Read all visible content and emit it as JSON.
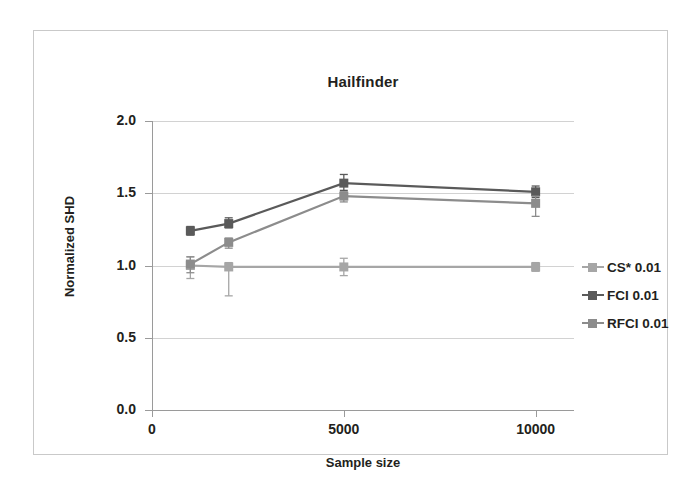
{
  "chart_data": {
    "type": "line",
    "title": "Hailfinder",
    "xlabel": "Sample size",
    "ylabel": "Normalized SHD",
    "x": [
      1000,
      2000,
      5000,
      10000
    ],
    "xlim": [
      0,
      11000
    ],
    "ylim": [
      0.0,
      2.0
    ],
    "xticks": [
      0,
      5000,
      10000
    ],
    "xtick_labels": [
      "0",
      "5000",
      "10000"
    ],
    "yticks": [
      0.0,
      0.5,
      1.0,
      1.5,
      2.0
    ],
    "ytick_labels": [
      "0.0",
      "0.5",
      "1.0",
      "1.5",
      "2.0"
    ],
    "grid": true,
    "legend_position": "right",
    "marker": "square",
    "error_bars": true,
    "series": [
      {
        "name": "CS* 0.01",
        "color": "#a6a6a6",
        "values": [
          1.0,
          0.99,
          0.99,
          0.99
        ],
        "err_low": [
          0.09,
          0.2,
          0.06,
          0.03
        ],
        "err_high": [
          0.06,
          0.03,
          0.06,
          0.03
        ]
      },
      {
        "name": "FCI 0.01",
        "color": "#5a5a5a",
        "values": [
          1.24,
          1.29,
          1.57,
          1.51
        ],
        "err_low": [
          0.03,
          0.03,
          0.05,
          0.04
        ],
        "err_high": [
          0.03,
          0.04,
          0.06,
          0.04
        ]
      },
      {
        "name": "RFCI 0.01",
        "color": "#8c8c8c",
        "values": [
          1.01,
          1.16,
          1.48,
          1.43
        ],
        "err_low": [
          0.06,
          0.04,
          0.04,
          0.09
        ],
        "err_high": [
          0.05,
          0.03,
          0.03,
          0.05
        ]
      }
    ]
  },
  "legend": {
    "items": [
      {
        "label": "CS* 0.01"
      },
      {
        "label": "FCI 0.01"
      },
      {
        "label": "RFCI 0.01"
      }
    ]
  }
}
